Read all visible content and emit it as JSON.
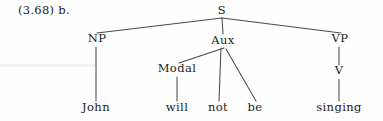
{
  "figure": {
    "example_number": "(3.68) b.",
    "ink_color": "#1b1b1b",
    "edge_color": "#4a4a4a",
    "background_color": "#fefefe"
  },
  "tree": {
    "nodes": [
      {
        "id": "S",
        "label": "S",
        "x": 222,
        "y": 14,
        "kind": "nonterminal"
      },
      {
        "id": "NP",
        "label": "NP",
        "x": 97,
        "y": 42,
        "kind": "nonterminal"
      },
      {
        "id": "Aux",
        "label": "Aux",
        "x": 223,
        "y": 44,
        "kind": "nonterminal"
      },
      {
        "id": "VP",
        "label": "VP",
        "x": 340,
        "y": 42,
        "kind": "nonterminal"
      },
      {
        "id": "Modal",
        "label": "Modal",
        "x": 177,
        "y": 72,
        "kind": "nonterminal"
      },
      {
        "id": "V",
        "label": "V",
        "x": 339,
        "y": 74,
        "kind": "nonterminal"
      },
      {
        "id": "John",
        "label": "John",
        "x": 96,
        "y": 111,
        "kind": "terminal"
      },
      {
        "id": "will",
        "label": "will",
        "x": 177,
        "y": 111,
        "kind": "terminal"
      },
      {
        "id": "not",
        "label": "not",
        "x": 218,
        "y": 111,
        "kind": "terminal"
      },
      {
        "id": "be",
        "label": "be",
        "x": 255,
        "y": 111,
        "kind": "terminal"
      },
      {
        "id": "singing",
        "label": "singing",
        "x": 339,
        "y": 111,
        "kind": "terminal"
      }
    ],
    "edges": [
      {
        "from": "S",
        "to": "NP",
        "x1": 222,
        "y1": 18,
        "x2": 97,
        "y2": 33
      },
      {
        "from": "S",
        "to": "Aux",
        "x1": 222,
        "y1": 18,
        "x2": 223,
        "y2": 34
      },
      {
        "from": "S",
        "to": "VP",
        "x1": 222,
        "y1": 18,
        "x2": 341,
        "y2": 33
      },
      {
        "from": "NP",
        "to": "John",
        "x1": 96,
        "y1": 47,
        "x2": 96,
        "y2": 101
      },
      {
        "from": "Aux",
        "to": "Modal",
        "x1": 224,
        "y1": 48,
        "x2": 179,
        "y2": 63
      },
      {
        "from": "Aux",
        "to": "not",
        "x1": 221,
        "y1": 48,
        "x2": 219,
        "y2": 101
      },
      {
        "from": "Aux",
        "to": "be",
        "x1": 226,
        "y1": 49,
        "x2": 256,
        "y2": 101
      },
      {
        "from": "Modal",
        "to": "will",
        "x1": 177,
        "y1": 77,
        "x2": 177,
        "y2": 101
      },
      {
        "from": "VP",
        "to": "V",
        "x1": 339,
        "y1": 47,
        "x2": 339,
        "y2": 65
      },
      {
        "from": "V",
        "to": "singing",
        "x1": 339,
        "y1": 79,
        "x2": 339,
        "y2": 101
      }
    ],
    "sentence": "John will not be singing"
  }
}
